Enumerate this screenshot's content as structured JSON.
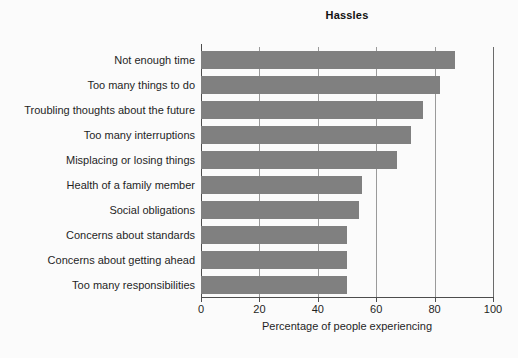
{
  "chart_data": {
    "type": "bar",
    "orientation": "horizontal",
    "title": "Hassles",
    "xlabel": "Percentage of people experiencing",
    "ylabel": "",
    "xlim": [
      0,
      100
    ],
    "xticks": [
      0,
      20,
      40,
      60,
      80,
      100
    ],
    "xtick_labels": [
      "0",
      "20",
      "40",
      "60",
      "80",
      "100"
    ],
    "grid": "vertical",
    "legend": null,
    "bar_color": "#808080",
    "categories": [
      "Not enough time",
      "Too many things to do",
      "Troubling thoughts about the future",
      "Too many interruptions",
      "Misplacing or losing things",
      "Health of a family member",
      "Social obligations",
      "Concerns about standards",
      "Concerns about getting ahead",
      "Too many responsibilities"
    ],
    "values": [
      87,
      82,
      76,
      72,
      67,
      55,
      54,
      50,
      50,
      50
    ]
  }
}
